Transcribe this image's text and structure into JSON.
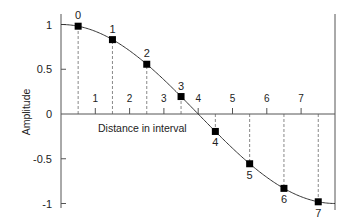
{
  "chart_data": {
    "type": "line",
    "title": "",
    "xlabel": "Distance in interval",
    "ylabel": "Amplitude",
    "ylim": [
      -1,
      1
    ],
    "yticks": [
      1,
      0.5,
      0,
      -0.5,
      -1
    ],
    "ytick_labels": [
      "1",
      "0.5",
      "0",
      "-0.5",
      "-1"
    ],
    "interval_tick_labels": [
      "1",
      "2",
      "3",
      "4",
      "5",
      "6",
      "7"
    ],
    "curve": "cosine half-period from 1 to -1",
    "samples": {
      "labels": [
        "0",
        "1",
        "2",
        "3",
        "4",
        "5",
        "6",
        "7"
      ],
      "values": [
        0.981,
        0.831,
        0.556,
        0.195,
        -0.195,
        -0.556,
        -0.831,
        -0.981
      ]
    },
    "grid": false,
    "legend": null
  },
  "colors": {
    "axis": "#555555",
    "curve": "#333333",
    "marker": "#000000",
    "dashed": "#888888"
  }
}
